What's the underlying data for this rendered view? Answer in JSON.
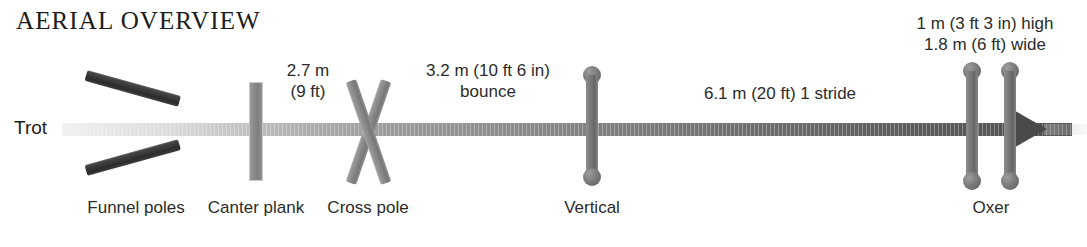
{
  "diagram": {
    "title": "AERIAL OVERVIEW",
    "gait_label": "Trot",
    "obstacles": [
      {
        "name": "funnel-poles",
        "label": "Funnel poles"
      },
      {
        "name": "canter-plank",
        "label": "Canter plank"
      },
      {
        "name": "cross-pole",
        "label": "Cross pole"
      },
      {
        "name": "vertical",
        "label": "Vertical"
      },
      {
        "name": "oxer",
        "label": "Oxer"
      }
    ],
    "distances": [
      {
        "name": "canter-plank-to-cross-pole",
        "line1": "2.7 m",
        "line2": "(9 ft)"
      },
      {
        "name": "cross-pole-to-vertical",
        "line1": "3.2 m (10 ft 6 in)",
        "line2": "bounce"
      },
      {
        "name": "vertical-to-oxer",
        "line1": "6.1 m (20 ft) 1 stride",
        "line2": ""
      }
    ],
    "oxer_spec": {
      "height": "1 m (3 ft 3 in) high",
      "width": "1.8 m (6 ft) wide"
    },
    "colors": {
      "track_dark": "#4a4a4a",
      "track_light": "#b0b0b0",
      "pole_dark": "#2c2c2c",
      "pole_gray": "#8a8a8a",
      "text": "#2b2b2b"
    }
  }
}
